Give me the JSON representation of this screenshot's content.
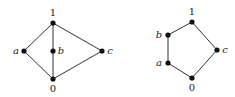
{
  "diagrams": [
    {
      "name": "M3",
      "nodes": [
        {
          "id": "1",
          "label": "1",
          "x": 53,
          "y": 23,
          "lx": 53,
          "ly": 16,
          "anchor": "middle",
          "italic": false
        },
        {
          "id": "a",
          "label": "a",
          "x": 24,
          "y": 51,
          "lx": 16,
          "ly": 54,
          "anchor": "middle",
          "italic": true
        },
        {
          "id": "b",
          "label": "b",
          "x": 53,
          "y": 51,
          "lx": 61,
          "ly": 54,
          "anchor": "middle",
          "italic": true
        },
        {
          "id": "c",
          "label": "c",
          "x": 102,
          "y": 51,
          "lx": 110,
          "ly": 54,
          "anchor": "middle",
          "italic": true
        },
        {
          "id": "0",
          "label": "0",
          "x": 53,
          "y": 79,
          "lx": 53,
          "ly": 92,
          "anchor": "middle",
          "italic": false
        }
      ],
      "edges": [
        [
          "1",
          "a"
        ],
        [
          "1",
          "b"
        ],
        [
          "b",
          "0"
        ],
        [
          "1",
          "c"
        ],
        [
          "a",
          "0"
        ],
        [
          "c",
          "0"
        ]
      ]
    },
    {
      "name": "N5",
      "nodes": [
        {
          "id": "1",
          "label": "1",
          "x": 192,
          "y": 22,
          "lx": 192,
          "ly": 15,
          "anchor": "middle",
          "italic": false
        },
        {
          "id": "b",
          "label": "b",
          "x": 168,
          "y": 35,
          "lx": 159,
          "ly": 38,
          "anchor": "middle",
          "italic": true
        },
        {
          "id": "a",
          "label": "a",
          "x": 168,
          "y": 63,
          "lx": 159,
          "ly": 66,
          "anchor": "middle",
          "italic": true
        },
        {
          "id": "c",
          "label": "c",
          "x": 217,
          "y": 50,
          "lx": 225,
          "ly": 53,
          "anchor": "middle",
          "italic": true
        },
        {
          "id": "0",
          "label": "0",
          "x": 192,
          "y": 78,
          "lx": 192,
          "ly": 91,
          "anchor": "middle",
          "italic": false
        }
      ],
      "edges": [
        [
          "1",
          "b"
        ],
        [
          "b",
          "a"
        ],
        [
          "a",
          "0"
        ],
        [
          "1",
          "c"
        ],
        [
          "c",
          "0"
        ]
      ]
    }
  ]
}
